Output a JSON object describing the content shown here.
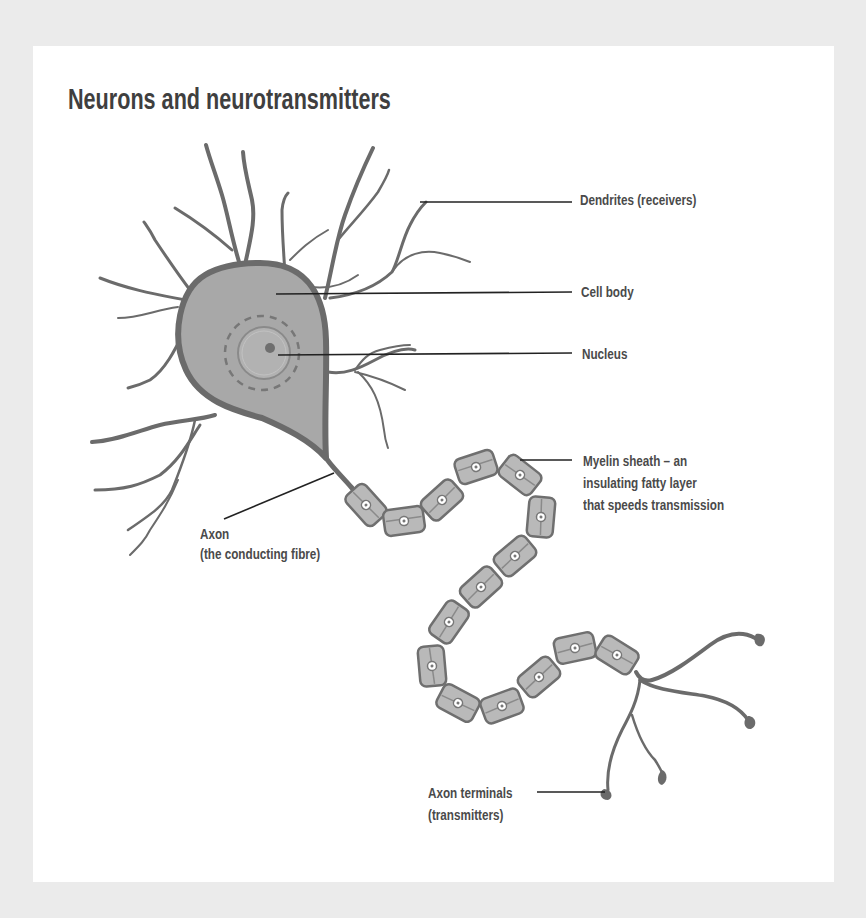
{
  "title": "Neurons and neurotransmitters",
  "colors": {
    "page_background": "#ebebeb",
    "card_background": "#ffffff",
    "neuron_outline": "#6b6b6b",
    "cell_body_fill": "#a8a8a8",
    "myelin_fill": "#b9b9b9",
    "leader_line": "#222222",
    "label_text": "#4a4a4a"
  },
  "labels": {
    "dendrites": {
      "text": "Dendrites (receivers)"
    },
    "cell_body": {
      "text": "Cell body"
    },
    "nucleus": {
      "text": "Nucleus"
    },
    "myelin": {
      "line1": "Myelin sheath – an",
      "line2": "insulating fatty layer",
      "line3": "that speeds transmission"
    },
    "axon": {
      "line1": "Axon",
      "line2": "(the conducting fibre)"
    },
    "axon_terminals": {
      "line1": "Axon terminals",
      "line2": "(transmitters)"
    }
  }
}
